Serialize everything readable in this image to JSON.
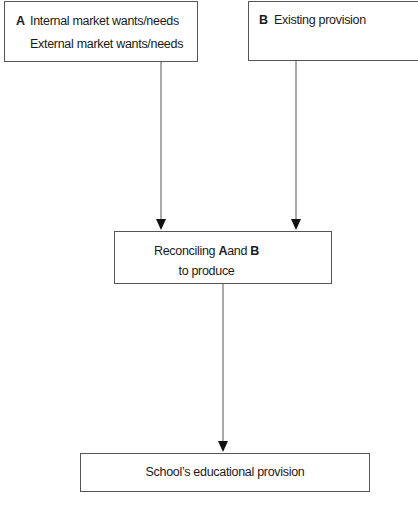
{
  "diagram": {
    "box_a": {
      "letter": "A",
      "lines": [
        "Internal market wants/needs",
        "External market wants/needs"
      ]
    },
    "box_b": {
      "letter": "B",
      "lines": [
        "Existing provision"
      ]
    },
    "box_reconcile": {
      "line1_prefix": "Reconciling ",
      "line1_a": "A",
      "line1_mid": "and ",
      "line1_b": "B",
      "line2": "to produce"
    },
    "box_output": {
      "label": "School’s educational provision"
    },
    "edges": [
      {
        "from": "box_a",
        "to": "box_reconcile"
      },
      {
        "from": "box_b",
        "to": "box_reconcile"
      },
      {
        "from": "box_reconcile",
        "to": "box_output"
      }
    ],
    "colors": {
      "line": "#555555",
      "arrowhead": "#111111",
      "text": "#1a1a1a"
    }
  }
}
